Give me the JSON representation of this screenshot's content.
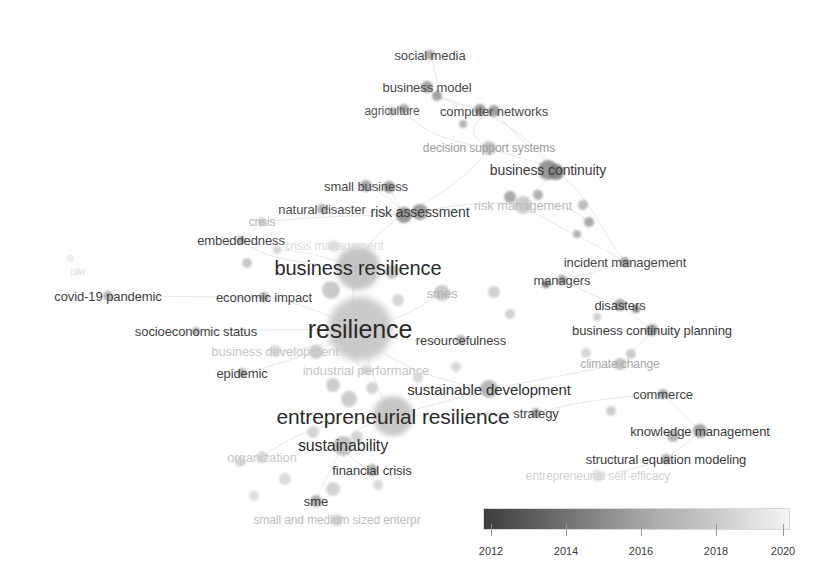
{
  "view": {
    "width": 835,
    "height": 580,
    "background": "#ffffff",
    "type": "vosviewer-overlay-map"
  },
  "chart_data": {
    "type": "scatter",
    "title": "",
    "xlabel": "",
    "ylabel": "",
    "grid": false,
    "legend_position": "bottom-right",
    "colorbar": {
      "label": "",
      "min_year": 2012,
      "max_year": 2020,
      "ticks": [
        2012,
        2014,
        2016,
        2018,
        2020
      ],
      "gradient_stops": [
        "#3d3d3d",
        "#6e6e6e",
        "#a2a2a2",
        "#c9c9c9",
        "#f4f4f4"
      ],
      "bar": {
        "x": 483,
        "y": 508,
        "width": 307,
        "height": 22
      },
      "tick_positions": [
        491,
        566,
        641,
        716,
        783
      ],
      "tick_label_y": 545
    },
    "nodes": [
      {
        "label": "social media",
        "x": 430,
        "y": 55,
        "r": 5,
        "font": 13,
        "color": "#4a4a4a",
        "node_color": "#9a9a9a",
        "lx": 430,
        "ly": 55
      },
      {
        "label": "business model",
        "x": 427,
        "y": 87,
        "r": 6,
        "font": 13,
        "color": "#4a4a4a",
        "node_color": "#8e8e8e",
        "lx": 427,
        "ly": 87
      },
      {
        "label": "agriculture",
        "x": 392,
        "y": 111,
        "r": 4,
        "font": 12,
        "color": "#555555",
        "node_color": "#a6a6a6",
        "lx": 392,
        "ly": 111
      },
      {
        "label": "computer networks",
        "x": 494,
        "y": 111,
        "r": 6,
        "font": 13,
        "color": "#4a4a4a",
        "node_color": "#8b8b8b",
        "lx": 494,
        "ly": 111
      },
      {
        "label": "decision support systems",
        "x": 489,
        "y": 148,
        "r": 7,
        "font": 12,
        "color": "#9d9d9d",
        "node_color": "#b8b8b8",
        "lx": 489,
        "ly": 148
      },
      {
        "label": "business continuity",
        "x": 548,
        "y": 170,
        "r": 10,
        "font": 14,
        "color": "#3b3b3b",
        "node_color": "#808080",
        "lx": 548,
        "ly": 170
      },
      {
        "label": "small business",
        "x": 366,
        "y": 186,
        "r": 6,
        "font": 13,
        "color": "#4a4a4a",
        "node_color": "#969696",
        "lx": 366,
        "ly": 186
      },
      {
        "label": "risk management",
        "x": 523,
        "y": 205,
        "r": 9,
        "font": 13,
        "color": "#bdbdbd",
        "node_color": "#c2c2c2",
        "lx": 523,
        "ly": 205
      },
      {
        "label": "natural disaster",
        "x": 322,
        "y": 209,
        "r": 5,
        "font": 13,
        "color": "#4e4e4e",
        "node_color": "#a0a0a0",
        "lx": 322,
        "ly": 209
      },
      {
        "label": "risk assessment",
        "x": 420,
        "y": 212,
        "r": 8,
        "font": 14,
        "color": "#3b3b3b",
        "node_color": "#8a8a8a",
        "lx": 420,
        "ly": 212
      },
      {
        "label": "crisis",
        "x": 262,
        "y": 222,
        "r": 4,
        "font": 12,
        "color": "#b5b5b5",
        "node_color": "#c4c4c4",
        "lx": 262,
        "ly": 222
      },
      {
        "label": "embeddedness",
        "x": 241,
        "y": 240,
        "r": 4,
        "font": 13,
        "color": "#3f3f3f",
        "node_color": "#9d9d9d",
        "lx": 241,
        "ly": 240
      },
      {
        "label": "crisis management",
        "x": 334,
        "y": 246,
        "r": 6,
        "font": 12,
        "color": "#dcdcdc",
        "node_color": "#dadada",
        "lx": 334,
        "ly": 246
      },
      {
        "label": "business resilience",
        "x": 358,
        "y": 268,
        "r": 22,
        "font": 20,
        "color": "#2b2b2b",
        "node_color": "#b7b7b7",
        "lx": 358,
        "ly": 268
      },
      {
        "label": "incident management",
        "x": 625,
        "y": 262,
        "r": 5,
        "font": 13,
        "color": "#474747",
        "node_color": "#8e8e8e",
        "lx": 625,
        "ly": 262
      },
      {
        "label": "managers",
        "x": 562,
        "y": 280,
        "r": 5,
        "font": 13,
        "color": "#4a4a4a",
        "node_color": "#8c8c8c",
        "lx": 562,
        "ly": 280
      },
      {
        "label": "covid-19 pandemic",
        "x": 108,
        "y": 296,
        "r": 5,
        "font": 13,
        "color": "#3f3f3f",
        "node_color": "#a3a3a3",
        "lx": 108,
        "ly": 296
      },
      {
        "label": "economic impact",
        "x": 264,
        "y": 297,
        "r": 5,
        "font": 13,
        "color": "#3f3f3f",
        "node_color": "#a3a3a3",
        "lx": 264,
        "ly": 297
      },
      {
        "label": "smes",
        "x": 442,
        "y": 293,
        "r": 8,
        "font": 13,
        "color": "#b0b0b0",
        "node_color": "#c0c0c0",
        "lx": 442,
        "ly": 293
      },
      {
        "label": "disasters",
        "x": 620,
        "y": 305,
        "r": 6,
        "font": 13,
        "color": "#3f3f3f",
        "node_color": "#8b8b8b",
        "lx": 620,
        "ly": 305
      },
      {
        "label": "socioeconomic status",
        "x": 196,
        "y": 331,
        "r": 4,
        "font": 13,
        "color": "#3f3f3f",
        "node_color": "#a6a6a6",
        "lx": 196,
        "ly": 331
      },
      {
        "label": "resilience",
        "x": 360,
        "y": 329,
        "r": 32,
        "font": 25,
        "color": "#2b2b2b",
        "node_color": "#bdbdbd",
        "lx": 360,
        "ly": 329
      },
      {
        "label": "resourcefulness",
        "x": 461,
        "y": 340,
        "r": 5,
        "font": 13,
        "color": "#3f3f3f",
        "node_color": "#a1a1a1",
        "lx": 461,
        "ly": 340
      },
      {
        "label": "business continuity planning",
        "x": 652,
        "y": 330,
        "r": 6,
        "font": 13,
        "color": "#3b3b3b",
        "node_color": "#8d8d8d",
        "lx": 652,
        "ly": 330
      },
      {
        "label": "business development",
        "x": 275,
        "y": 351,
        "r": 6,
        "font": 13,
        "color": "#c6c6c6",
        "node_color": "#d2d2d2",
        "lx": 275,
        "ly": 351
      },
      {
        "label": "climate change",
        "x": 620,
        "y": 364,
        "r": 6,
        "font": 12,
        "color": "#a8a8a8",
        "node_color": "#b4b4b4",
        "lx": 620,
        "ly": 364
      },
      {
        "label": "industrial performance",
        "x": 366,
        "y": 370,
        "r": 5,
        "font": 13,
        "color": "#c6c6c6",
        "node_color": "#d2d2d2",
        "lx": 366,
        "ly": 370
      },
      {
        "label": "epidemic",
        "x": 242,
        "y": 373,
        "r": 5,
        "font": 13,
        "color": "#3f3f3f",
        "node_color": "#a3a3a3",
        "lx": 242,
        "ly": 373
      },
      {
        "label": "commerce",
        "x": 663,
        "y": 394,
        "r": 5,
        "font": 13,
        "color": "#454545",
        "node_color": "#9a9a9a",
        "lx": 663,
        "ly": 394
      },
      {
        "label": "sustainable development",
        "x": 489,
        "y": 389,
        "r": 9,
        "font": 15,
        "color": "#2f2f2f",
        "node_color": "#a8a8a8",
        "lx": 489,
        "ly": 389
      },
      {
        "label": "entrepreneurial resilience",
        "x": 393,
        "y": 416,
        "r": 20,
        "font": 21,
        "color": "#2b2b2b",
        "node_color": "#bbbbbb",
        "lx": 393,
        "ly": 416
      },
      {
        "label": "strategy",
        "x": 536,
        "y": 413,
        "r": 5,
        "font": 13,
        "color": "#3f3f3f",
        "node_color": "#a3a3a3",
        "lx": 536,
        "ly": 413
      },
      {
        "label": "knowledge management",
        "x": 700,
        "y": 431,
        "r": 7,
        "font": 13,
        "color": "#3b3b3b",
        "node_color": "#8d8d8d",
        "lx": 700,
        "ly": 431
      },
      {
        "label": "sustainability",
        "x": 343,
        "y": 446,
        "r": 10,
        "font": 16,
        "color": "#2f2f2f",
        "node_color": "#b4b4b4",
        "lx": 343,
        "ly": 446
      },
      {
        "label": "organization",
        "x": 262,
        "y": 457,
        "r": 6,
        "font": 13,
        "color": "#c9c9c9",
        "node_color": "#d4d4d4",
        "lx": 262,
        "ly": 457
      },
      {
        "label": "structural equation modeling",
        "x": 666,
        "y": 459,
        "r": 5,
        "font": 13,
        "color": "#3b3b3b",
        "node_color": "#9a9a9a",
        "lx": 666,
        "ly": 459
      },
      {
        "label": "financial crisis",
        "x": 372,
        "y": 470,
        "r": 6,
        "font": 13,
        "color": "#3b3b3b",
        "node_color": "#a0a0a0",
        "lx": 372,
        "ly": 470
      },
      {
        "label": "entrepreneurial self-efficacy",
        "x": 598,
        "y": 476,
        "r": 6,
        "font": 12,
        "color": "#d2d2d2",
        "node_color": "#dadada",
        "lx": 598,
        "ly": 476
      },
      {
        "label": "sme",
        "x": 316,
        "y": 501,
        "r": 6,
        "font": 13,
        "color": "#3b3b3b",
        "node_color": "#9e9e9e",
        "lx": 316,
        "ly": 501
      },
      {
        "label": "small and medium sized enterpr",
        "x": 337,
        "y": 520,
        "r": 6,
        "font": 12,
        "color": "#bdbdbd",
        "node_color": "#cccccc",
        "lx": 337,
        "ly": 520
      }
    ],
    "extra_markers": [
      {
        "x": 437,
        "y": 96,
        "r": 5,
        "color": "#949494"
      },
      {
        "x": 463,
        "y": 124,
        "r": 4,
        "color": "#a8a8a8"
      },
      {
        "x": 510,
        "y": 197,
        "r": 6,
        "color": "#9c9c9c"
      },
      {
        "x": 538,
        "y": 195,
        "r": 5,
        "color": "#a5a5a5"
      },
      {
        "x": 583,
        "y": 205,
        "r": 5,
        "color": "#b0b0b0"
      },
      {
        "x": 589,
        "y": 222,
        "r": 5,
        "color": "#9c9c9c"
      },
      {
        "x": 577,
        "y": 234,
        "r": 4,
        "color": "#a8a8a8"
      },
      {
        "x": 247,
        "y": 263,
        "r": 5,
        "color": "#c0c0c0"
      },
      {
        "x": 277,
        "y": 250,
        "r": 4,
        "color": "#d0d0d0"
      },
      {
        "x": 331,
        "y": 290,
        "r": 9,
        "color": "#c2c2c2"
      },
      {
        "x": 392,
        "y": 272,
        "r": 7,
        "color": "#c0c0c0"
      },
      {
        "x": 398,
        "y": 300,
        "r": 6,
        "color": "#cfcfcf"
      },
      {
        "x": 494,
        "y": 292,
        "r": 6,
        "color": "#c9c9c9"
      },
      {
        "x": 510,
        "y": 314,
        "r": 5,
        "color": "#c9c9c9"
      },
      {
        "x": 586,
        "y": 353,
        "r": 5,
        "color": "#cfcfcf"
      },
      {
        "x": 597,
        "y": 317,
        "r": 4,
        "color": "#c9c9c9"
      },
      {
        "x": 316,
        "y": 352,
        "r": 7,
        "color": "#c2c2c2"
      },
      {
        "x": 333,
        "y": 385,
        "r": 7,
        "color": "#c6c6c6"
      },
      {
        "x": 349,
        "y": 399,
        "r": 8,
        "color": "#c4c4c4"
      },
      {
        "x": 372,
        "y": 388,
        "r": 6,
        "color": "#cccccc"
      },
      {
        "x": 418,
        "y": 378,
        "r": 5,
        "color": "#d2d2d2"
      },
      {
        "x": 456,
        "y": 367,
        "r": 5,
        "color": "#d2d2d2"
      },
      {
        "x": 313,
        "y": 432,
        "r": 6,
        "color": "#cfcfcf"
      },
      {
        "x": 357,
        "y": 437,
        "r": 6,
        "color": "#cccccc"
      },
      {
        "x": 285,
        "y": 479,
        "r": 6,
        "color": "#d6d6d6"
      },
      {
        "x": 333,
        "y": 489,
        "r": 7,
        "color": "#cccccc"
      },
      {
        "x": 378,
        "y": 485,
        "r": 5,
        "color": "#d2d2d2"
      },
      {
        "x": 254,
        "y": 496,
        "r": 5,
        "color": "#dadada"
      },
      {
        "x": 240,
        "y": 462,
        "r": 5,
        "color": "#d2d2d2"
      },
      {
        "x": 673,
        "y": 436,
        "r": 6,
        "color": "#a8a8a8"
      },
      {
        "x": 611,
        "y": 411,
        "r": 5,
        "color": "#c9c9c9"
      },
      {
        "x": 631,
        "y": 354,
        "r": 5,
        "color": "#c2c2c2"
      },
      {
        "x": 546,
        "y": 284,
        "r": 4,
        "color": "#6e6e6e"
      },
      {
        "x": 636,
        "y": 309,
        "r": 4,
        "color": "#7a7a7a"
      },
      {
        "x": 404,
        "y": 109,
        "r": 5,
        "color": "#9a9a9a"
      },
      {
        "x": 480,
        "y": 110,
        "r": 6,
        "color": "#8b8b8b"
      },
      {
        "x": 556,
        "y": 172,
        "r": 8,
        "color": "#7a7a7a"
      },
      {
        "x": 389,
        "y": 187,
        "r": 6,
        "color": "#8e8e8e"
      },
      {
        "x": 404,
        "y": 215,
        "r": 8,
        "color": "#878787"
      },
      {
        "x": 71,
        "y": 259,
        "r": 3,
        "color": "#ededed"
      },
      {
        "x": 78,
        "y": 272,
        "r": 3,
        "color": "#ebebeb"
      }
    ],
    "faint_labels": [
      {
        "text": "is",
        "x": 70,
        "y": 258,
        "font": 10,
        "color": "#e6e6e6"
      },
      {
        "text": "p/w",
        "x": 78,
        "y": 272,
        "font": 10,
        "color": "#e4e4e4"
      }
    ]
  }
}
